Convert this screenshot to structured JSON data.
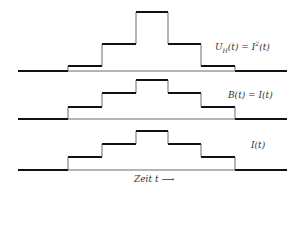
{
  "diagram": {
    "x_steps": [
      18,
      68,
      102,
      136,
      168,
      201,
      235,
      287
    ],
    "panels": [
      {
        "name": "uh-panel",
        "label": "U_H(t) = I²(t)",
        "label_parts": {
          "u": "U",
          "sub": "H",
          "rest1": "(t) = I",
          "sup": "2",
          "rest2": "(t)"
        },
        "baseline": 71,
        "levels": [
          71,
          66,
          44,
          12,
          44,
          66,
          71
        ],
        "label_pos": {
          "x": 215,
          "y": 46
        }
      },
      {
        "name": "b-panel",
        "label": "B(t) = I(t)",
        "baseline": 119,
        "levels": [
          119,
          107,
          93,
          80,
          93,
          107,
          119
        ],
        "label_pos": {
          "x": 228,
          "y": 93
        }
      },
      {
        "name": "i-panel",
        "label": "I(t)",
        "baseline": 170,
        "levels": [
          170,
          157,
          144,
          131,
          144,
          157,
          170
        ],
        "label_pos": {
          "x": 251,
          "y": 143
        }
      }
    ],
    "time_axis": {
      "label": "Zeit t",
      "arrow": "⟶"
    }
  }
}
